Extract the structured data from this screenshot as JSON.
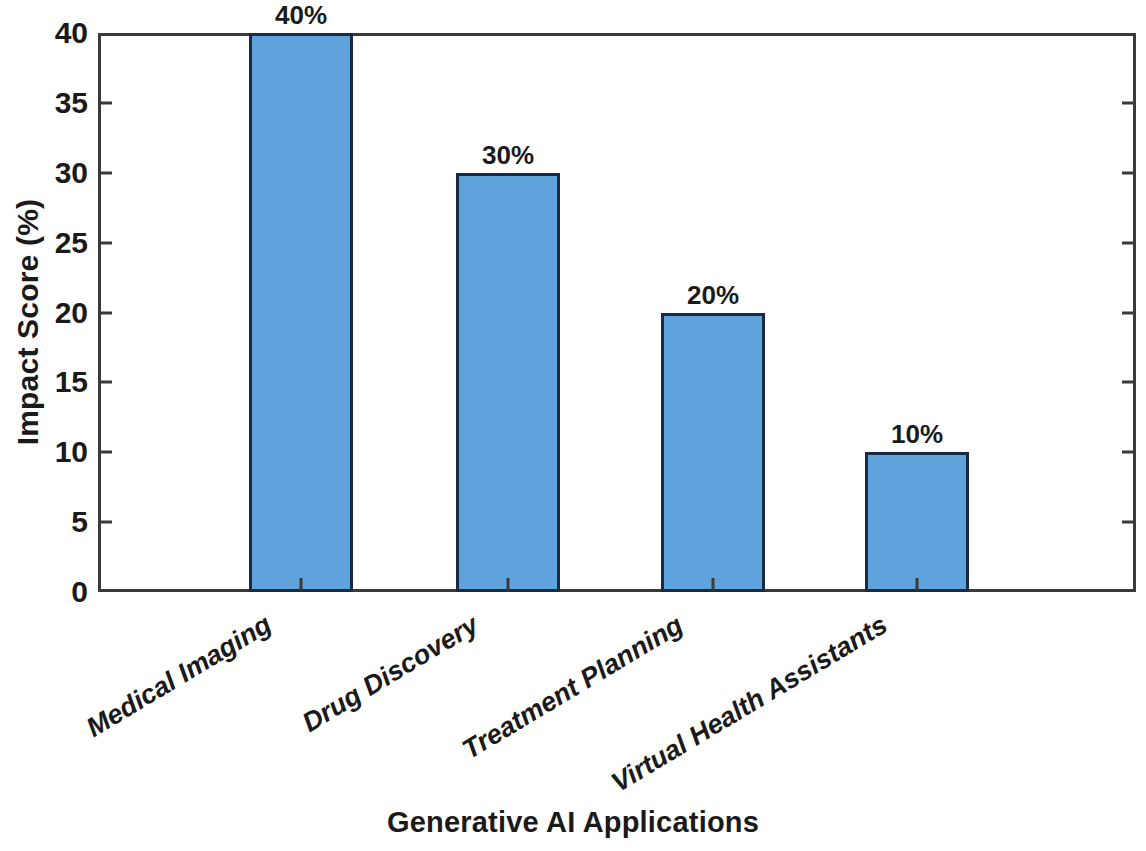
{
  "chart_data": {
    "type": "bar",
    "title": "",
    "xlabel": "Generative AI Applications",
    "ylabel": "Impact Score (%)",
    "categories": [
      "Medical Imaging",
      "Drug Discovery",
      "Treatment Planning",
      "Virtual Health Assistants"
    ],
    "values": [
      40,
      30,
      20,
      10
    ],
    "data_labels": [
      "40%",
      "30%",
      "20%",
      "10%"
    ],
    "ylim": [
      0,
      40
    ],
    "yticks": [
      0,
      5,
      10,
      15,
      20,
      25,
      30,
      35,
      40
    ],
    "ytick_labels": [
      "0",
      "5",
      "10",
      "15",
      "20",
      "25",
      "30",
      "35",
      "40"
    ],
    "grid": false,
    "legend": false,
    "bar_color": "#5FA3DC",
    "bar_edge_color": "#1B2A44",
    "axis_color": "#3A3A3A",
    "text_color": "#1A1A1A",
    "background": "#FFFFFF",
    "xtick_label_rotation": -31
  }
}
